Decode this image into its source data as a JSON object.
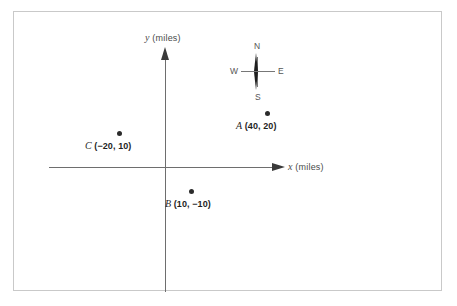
{
  "figure": {
    "name": "coordinate-plane-with-compass",
    "axes": {
      "x_label": "x",
      "x_units": "(miles)",
      "y_label": "y",
      "y_units": "(miles)"
    },
    "compass": {
      "north": "N",
      "south": "S",
      "west": "W",
      "east": "E"
    },
    "points": [
      {
        "name": "A",
        "coords": "(40, 20)"
      },
      {
        "name": "B",
        "coords": "(10, −10)"
      },
      {
        "name": "C",
        "coords": "(−20, 10)"
      }
    ]
  },
  "chart_data": {
    "type": "scatter",
    "title": "",
    "xlabel": "x (miles)",
    "ylabel": "y (miles)",
    "xlim": [
      -60,
      60
    ],
    "ylim": [
      -45,
      45
    ],
    "grid": false,
    "legend": null,
    "series": [
      {
        "name": "points",
        "points": [
          {
            "label": "A",
            "x": 40,
            "y": 20
          },
          {
            "label": "B",
            "x": 10,
            "y": -10
          },
          {
            "label": "C",
            "x": -20,
            "y": 10
          }
        ]
      }
    ],
    "annotations": [
      {
        "text": "N",
        "role": "compass-north"
      },
      {
        "text": "S",
        "role": "compass-south"
      },
      {
        "text": "W",
        "role": "compass-west"
      },
      {
        "text": "E",
        "role": "compass-east"
      }
    ]
  }
}
